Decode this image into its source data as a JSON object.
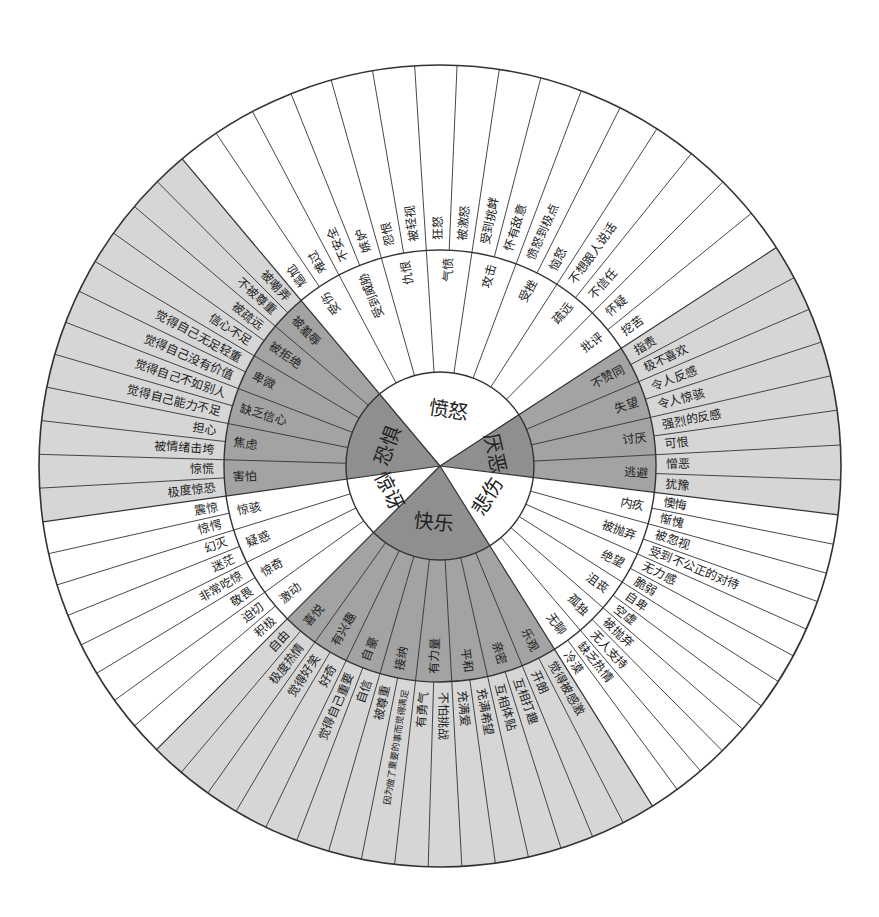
{
  "center": {
    "x": 440,
    "y": 466
  },
  "radii": {
    "inner": 94,
    "middle": 216,
    "outer": 401
  },
  "colors": {
    "line": "#333333",
    "white": "#ffffff",
    "dark_inner": "#8f8f8f",
    "dark_middle": "#a3a3a3",
    "dark_outer": "#d6d6d6"
  },
  "sectors": [
    {
      "name": "愤怒",
      "shade": "white",
      "start": -40,
      "end": 57,
      "middle": [
        {
          "label": "受伤",
          "outer": [
            "尴尬",
            "难过"
          ]
        },
        {
          "label": "受到威胁",
          "outer": [
            "不安全",
            "嫉妒"
          ]
        },
        {
          "label": "仇恨",
          "outer": [
            "怨恨",
            "被轻视"
          ]
        },
        {
          "label": "气愤",
          "outer": [
            "狂怒",
            "被激怒"
          ]
        },
        {
          "label": "攻击",
          "outer": [
            "受到挑衅",
            "怀有敌意"
          ]
        },
        {
          "label": "受挫",
          "outer": [
            "愤怒到极点",
            "恼怒"
          ]
        },
        {
          "label": "疏远",
          "outer": [
            "不想跟人说话",
            "不信任"
          ]
        },
        {
          "label": "批评",
          "outer": [
            "怀疑",
            "挖苦"
          ]
        }
      ]
    },
    {
      "name": "厌恶",
      "shade": "dark",
      "start": 57,
      "end": 97,
      "middle": [
        {
          "label": "不赞同",
          "outer": [
            "指责",
            "极不喜欢"
          ]
        },
        {
          "label": "失望",
          "outer": [
            "令人反感",
            "令人惊骇"
          ]
        },
        {
          "label": "讨厌",
          "outer": [
            "强烈的反感",
            "可恨"
          ]
        },
        {
          "label": "逃避",
          "outer": [
            "憎恶",
            "犹豫"
          ]
        }
      ]
    },
    {
      "name": "悲伤",
      "shade": "white",
      "start": 97,
      "end": 148,
      "middle": [
        {
          "label": "内疚",
          "outer": [
            "懊悔",
            "惭愧"
          ]
        },
        {
          "label": "被抛弃",
          "outer": [
            "被忽视",
            "受到不公正的对待"
          ]
        },
        {
          "label": "绝望",
          "outer": [
            "无力感",
            "脆弱"
          ]
        },
        {
          "label": "沮丧",
          "outer": [
            "自卑",
            "空虚"
          ]
        },
        {
          "label": "孤独",
          "outer": [
            "被抛弃",
            "无人支持"
          ]
        },
        {
          "label": "无聊",
          "outer": [
            "缺乏热情",
            "冷漠"
          ]
        }
      ]
    },
    {
      "name": "快乐",
      "shade": "dark",
      "start": 148,
      "end": 225,
      "middle": [
        {
          "label": "乐观",
          "outer": [
            "觉得被感激",
            "开朗"
          ]
        },
        {
          "label": "亲密",
          "outer": [
            "互相打趣",
            "互相体贴"
          ]
        },
        {
          "label": "平和",
          "outer": [
            "充满希望",
            "充满爱"
          ]
        },
        {
          "label": "有力量",
          "outer": [
            "不怕挑战",
            "有勇气"
          ]
        },
        {
          "label": "接纳",
          "outer": [
            "因为做了重要的事而觉得满足",
            "被尊重"
          ]
        },
        {
          "label": "自豪",
          "outer": [
            "自信",
            "觉得自己重要"
          ]
        },
        {
          "label": "有兴趣",
          "outer": [
            "好奇",
            "觉得好笑"
          ]
        },
        {
          "label": "喜悦",
          "outer": [
            "极度热情",
            "自由"
          ]
        }
      ]
    },
    {
      "name": "惊讶",
      "shade": "white",
      "start": 225,
      "end": 262,
      "middle": [
        {
          "label": "激动",
          "outer": [
            "积极",
            "迫切"
          ]
        },
        {
          "label": "惊奇",
          "outer": [
            "敬畏",
            "非常吃惊"
          ]
        },
        {
          "label": "疑惑",
          "outer": [
            "迷茫",
            "幻灭"
          ]
        },
        {
          "label": "惊骇",
          "outer": [
            "惊愕",
            "震惊"
          ]
        }
      ]
    },
    {
      "name": "恐惧",
      "shade": "dark",
      "start": 262,
      "end": 320,
      "middle": [
        {
          "label": "害怕",
          "outer": [
            "极度惊恐",
            "惊慌"
          ]
        },
        {
          "label": "焦虑",
          "outer": [
            "被情绪击垮",
            "担心"
          ]
        },
        {
          "label": "缺乏信心",
          "outer": [
            "觉得自己能力不足",
            "觉得自己不如别人"
          ]
        },
        {
          "label": "卑微",
          "outer": [
            "觉得自己没有价值",
            "觉得自己无足轻重"
          ]
        },
        {
          "label": "被拒绝",
          "outer": [
            "信心不足",
            "被疏远"
          ]
        },
        {
          "label": "被羞辱",
          "outer": [
            "不被尊重",
            "被嘲弄"
          ]
        }
      ]
    }
  ]
}
